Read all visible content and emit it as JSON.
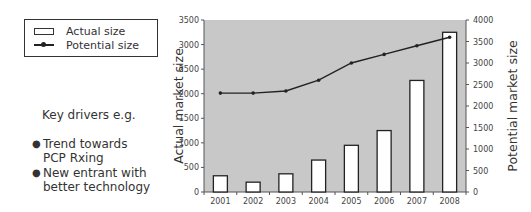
{
  "legend": {
    "items": [
      {
        "label": "Actual size",
        "icon": "bar-swatch-icon"
      },
      {
        "label": "Potential size",
        "icon": "line-marker-swatch-icon"
      }
    ]
  },
  "notes": {
    "heading": "Key drivers e.g.",
    "bullets": [
      "Trend towards\nPCP Rxing",
      "New entrant with\nbetter technology"
    ]
  },
  "colors": {
    "plot_background": "#c8c8c8",
    "bar_fill": "#ffffff",
    "bar_border": "#222222",
    "line": "#222222"
  },
  "chart_data": {
    "type": "bar+line",
    "title": "",
    "categories": [
      "2001",
      "2002",
      "2003",
      "2004",
      "2005",
      "2006",
      "2007",
      "2008"
    ],
    "series": [
      {
        "name": "Actual size",
        "type": "bar",
        "axis": "left",
        "values": [
          330,
          200,
          370,
          650,
          950,
          1250,
          2270,
          3250
        ]
      },
      {
        "name": "Potential size",
        "type": "line",
        "axis": "right",
        "values": [
          2300,
          2300,
          2350,
          2600,
          3000,
          3200,
          3400,
          3600
        ]
      }
    ],
    "xlabel": "",
    "ylabel": "Actual market size",
    "y2label": "Potential market size",
    "ylim": [
      0,
      3500
    ],
    "y2lim": [
      0,
      4000
    ],
    "yticks": [
      "0",
      "500",
      "1000",
      "1500",
      "2000",
      "2500",
      "3000",
      "3500"
    ],
    "y2ticks": [
      "0",
      "500",
      "1000",
      "1500",
      "2000",
      "2500",
      "3000",
      "3500",
      "4000"
    ],
    "grid": false,
    "legend_position": "top-left, outside plot"
  }
}
